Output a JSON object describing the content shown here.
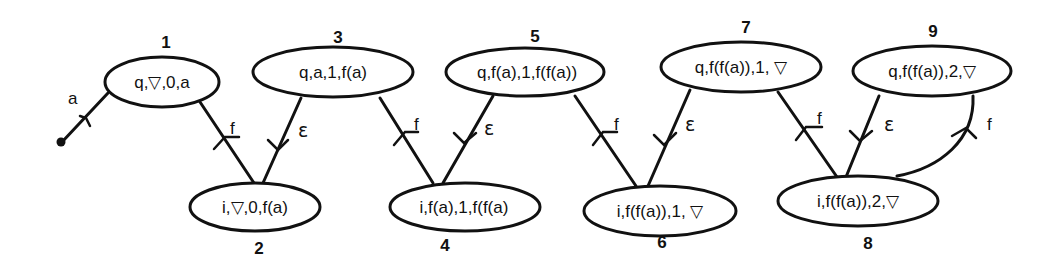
{
  "diagram": {
    "nodes": [
      {
        "id": "1",
        "number": "1",
        "label": "q,▽,0,a"
      },
      {
        "id": "2",
        "number": "2",
        "label": "i,▽,0,f(a)"
      },
      {
        "id": "3",
        "number": "3",
        "label": "q,a,1,f(a)"
      },
      {
        "id": "4",
        "number": "4",
        "label": "i,f(a),1,f(f(a)"
      },
      {
        "id": "5",
        "number": "5",
        "label": "q,f(a),1,f(f(a))"
      },
      {
        "id": "6",
        "number": "6",
        "label": "i,f(f(a)),1,  ▽"
      },
      {
        "id": "7",
        "number": "7",
        "label": "q,f(f(a)),1,  ▽"
      },
      {
        "id": "8",
        "number": "8",
        "label": "i,f(f(a)),2,▽"
      },
      {
        "id": "9",
        "number": "9",
        "label": "q,f(f(a)),2,▽"
      }
    ],
    "edges": [
      {
        "from": "start",
        "to": "1",
        "label": "a"
      },
      {
        "from": "1",
        "to": "2",
        "label": "f"
      },
      {
        "from": "3",
        "to": "2",
        "label": "ε"
      },
      {
        "from": "3",
        "to": "4",
        "label": "f"
      },
      {
        "from": "5",
        "to": "4",
        "label": "ε"
      },
      {
        "from": "5",
        "to": "6",
        "label": "f"
      },
      {
        "from": "7",
        "to": "6",
        "label": "ε"
      },
      {
        "from": "7",
        "to": "8",
        "label": "f"
      },
      {
        "from": "9",
        "to": "8",
        "label": "ε"
      },
      {
        "from": "8",
        "to": "9",
        "label": "f"
      }
    ]
  }
}
